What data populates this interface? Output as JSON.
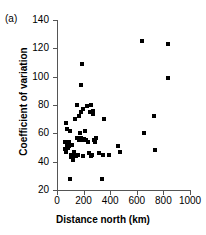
{
  "panel": {
    "label": "(a)"
  },
  "chart_data": {
    "type": "scatter",
    "title": "",
    "panel_label": "(a)",
    "xlabel": "Distance north (km)",
    "ylabel": "Coefficient of variation",
    "xlim": [
      0,
      1000
    ],
    "ylim": [
      20,
      140
    ],
    "xticks": [
      0,
      200,
      400,
      600,
      800,
      1000
    ],
    "yticks": [
      20,
      40,
      60,
      80,
      100,
      120,
      140
    ],
    "xtick_labels": [
      "0",
      "200",
      "400",
      "600",
      "800",
      "1000"
    ],
    "ytick_labels": [
      "20",
      "40",
      "60",
      "80",
      "100",
      "120",
      "140"
    ],
    "grid": false,
    "legend": null,
    "marker": "square",
    "marker_color": "#000000",
    "points": [
      {
        "x": 60,
        "y": 54
      },
      {
        "x": 62,
        "y": 49
      },
      {
        "x": 65,
        "y": 67
      },
      {
        "x": 70,
        "y": 47
      },
      {
        "x": 72,
        "y": 63
      },
      {
        "x": 78,
        "y": 52
      },
      {
        "x": 82,
        "y": 50
      },
      {
        "x": 88,
        "y": 54
      },
      {
        "x": 92,
        "y": 51
      },
      {
        "x": 95,
        "y": 28
      },
      {
        "x": 100,
        "y": 62
      },
      {
        "x": 104,
        "y": 45
      },
      {
        "x": 108,
        "y": 43
      },
      {
        "x": 112,
        "y": 52
      },
      {
        "x": 115,
        "y": 44
      },
      {
        "x": 120,
        "y": 41
      },
      {
        "x": 126,
        "y": 47
      },
      {
        "x": 130,
        "y": 45
      },
      {
        "x": 135,
        "y": 70
      },
      {
        "x": 140,
        "y": 44
      },
      {
        "x": 148,
        "y": 57
      },
      {
        "x": 152,
        "y": 80
      },
      {
        "x": 158,
        "y": 45
      },
      {
        "x": 162,
        "y": 72
      },
      {
        "x": 168,
        "y": 55
      },
      {
        "x": 172,
        "y": 60
      },
      {
        "x": 176,
        "y": 56
      },
      {
        "x": 180,
        "y": 57
      },
      {
        "x": 182,
        "y": 75
      },
      {
        "x": 184,
        "y": 94
      },
      {
        "x": 186,
        "y": 56
      },
      {
        "x": 188,
        "y": 109
      },
      {
        "x": 192,
        "y": 77
      },
      {
        "x": 195,
        "y": 55
      },
      {
        "x": 198,
        "y": 44
      },
      {
        "x": 205,
        "y": 56
      },
      {
        "x": 212,
        "y": 62
      },
      {
        "x": 218,
        "y": 55
      },
      {
        "x": 224,
        "y": 79
      },
      {
        "x": 232,
        "y": 54
      },
      {
        "x": 240,
        "y": 46
      },
      {
        "x": 246,
        "y": 75
      },
      {
        "x": 252,
        "y": 44
      },
      {
        "x": 258,
        "y": 80
      },
      {
        "x": 262,
        "y": 45
      },
      {
        "x": 268,
        "y": 74
      },
      {
        "x": 274,
        "y": 76
      },
      {
        "x": 278,
        "y": 55
      },
      {
        "x": 282,
        "y": 54
      },
      {
        "x": 292,
        "y": 57
      },
      {
        "x": 318,
        "y": 46
      },
      {
        "x": 338,
        "y": 28
      },
      {
        "x": 344,
        "y": 45
      },
      {
        "x": 352,
        "y": 70
      },
      {
        "x": 388,
        "y": 45
      },
      {
        "x": 462,
        "y": 51
      },
      {
        "x": 470,
        "y": 47
      },
      {
        "x": 640,
        "y": 125
      },
      {
        "x": 652,
        "y": 60
      },
      {
        "x": 730,
        "y": 72
      },
      {
        "x": 735,
        "y": 48
      },
      {
        "x": 832,
        "y": 123
      },
      {
        "x": 836,
        "y": 99
      }
    ]
  }
}
